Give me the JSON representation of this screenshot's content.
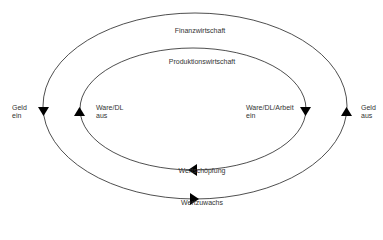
{
  "diagram": {
    "outer_cycle": {
      "title": "Finanzwirtschaft",
      "bottom_label": "Wertzuwachs"
    },
    "inner_cycle": {
      "title": "Produktionswirtschaft",
      "bottom_label": "Wertschöpfung"
    },
    "left_outer": {
      "line1": "Geld",
      "line2": "ein"
    },
    "left_inner": {
      "line1": "Ware/DL",
      "line2": "aus"
    },
    "right_inner": {
      "line1": "Ware/DL/Arbeit",
      "line2": "ein"
    },
    "right_outer": {
      "line1": "Geld",
      "line2": "aus"
    },
    "colors": {
      "line": "#222222",
      "text": "#333333",
      "background": "#ffffff"
    }
  }
}
